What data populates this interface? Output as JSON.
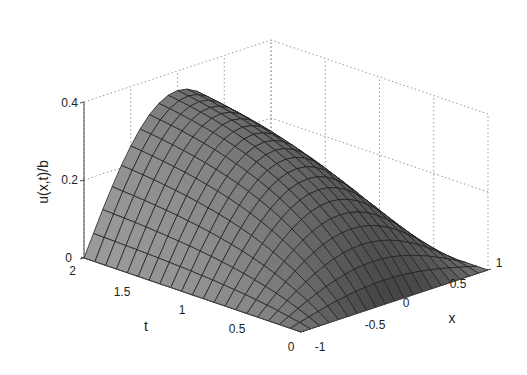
{
  "chart_data": {
    "type": "surface3d",
    "title": "",
    "zlabel": "u(x,t)/b",
    "xlabel": "x",
    "ylabel": "t",
    "x_range": [
      -1,
      1
    ],
    "t_range": [
      0,
      2
    ],
    "z_range": [
      0,
      0.4
    ],
    "x_ticks": [
      "-1",
      "-0.5",
      "0",
      "0.5",
      "1"
    ],
    "t_ticks": [
      "0",
      "0.5",
      "1",
      "1.5",
      "2"
    ],
    "z_ticks": [
      "0",
      "0.2",
      "0.4"
    ],
    "grid": "dotted",
    "surface": {
      "description": "u(x,t)/b rises from 0 at t=0, symmetric in x with zero at x=+/-1, peaking about 0.35 at x=0, t=2",
      "peak_value": 0.35,
      "mesh_x_lines": 21,
      "mesh_t_lines": 21,
      "shading": "grayscale"
    },
    "colors": {
      "surface": "#9a9a9a",
      "mesh": "#222222",
      "grid": "#999999",
      "axis": "#444444"
    }
  }
}
